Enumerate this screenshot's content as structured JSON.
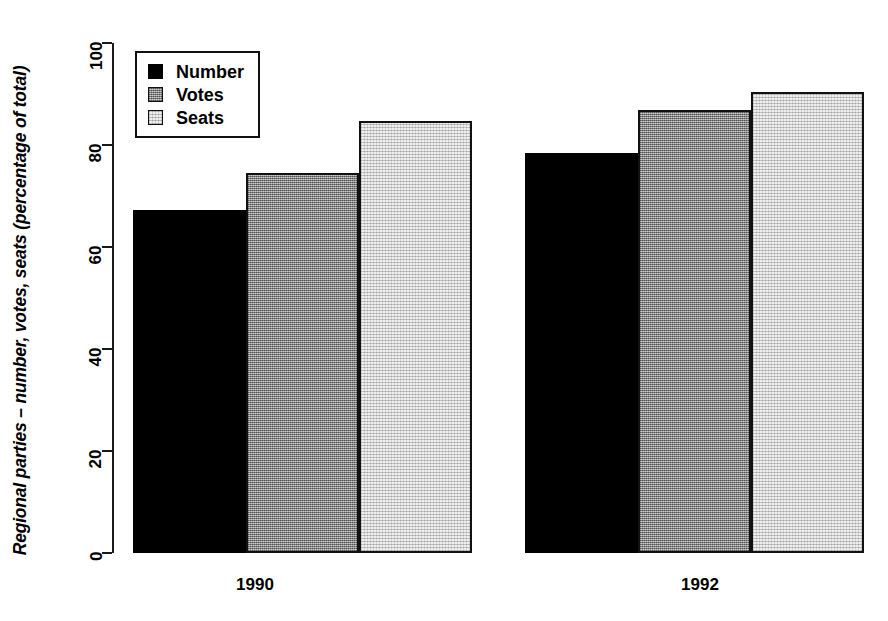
{
  "chart_data": {
    "type": "bar",
    "title": "",
    "xlabel": "",
    "ylabel": "Regional parties – number, votes, seats (percentage of total)",
    "ylim": [
      0,
      100
    ],
    "yticks": [
      0,
      20,
      40,
      60,
      80,
      100
    ],
    "ytick_labels": [
      "0",
      "20",
      "40",
      "60",
      "80",
      "100"
    ],
    "categories": [
      "1990",
      "1992"
    ],
    "grid": false,
    "legend_position": "top-left",
    "series": [
      {
        "name": "Number",
        "fill": "fill-number",
        "color": "#000000",
        "values": [
          67.3,
          78.5
        ]
      },
      {
        "name": "Votes",
        "fill": "fill-votes",
        "color": "#9d9d9d",
        "values": [
          74.5,
          86.8
        ]
      },
      {
        "name": "Seats",
        "fill": "fill-seats",
        "color": "#dedede",
        "values": [
          84.8,
          90.3
        ]
      }
    ]
  },
  "legend": {
    "items": [
      {
        "label": "Number",
        "fill": "fill-number"
      },
      {
        "label": "Votes",
        "fill": "fill-votes"
      },
      {
        "label": "Seats",
        "fill": "fill-seats"
      }
    ]
  }
}
